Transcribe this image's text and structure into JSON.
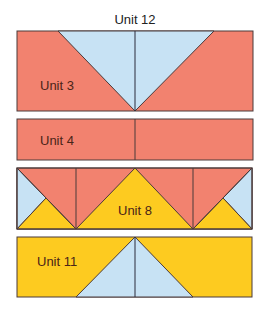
{
  "title": "Unit 12",
  "colors": {
    "salmon": "#F2826F",
    "blue": "#C7E2F4",
    "yellow": "#FDCB20",
    "stroke": "#4a3a3a"
  },
  "blocks": [
    {
      "id": "unit3-row",
      "label": "Unit 3"
    },
    {
      "id": "unit4-row",
      "label": "Unit 4"
    },
    {
      "id": "unit8-row",
      "label": "Unit 8"
    },
    {
      "id": "unit11-row",
      "label": "Unit 11"
    }
  ]
}
